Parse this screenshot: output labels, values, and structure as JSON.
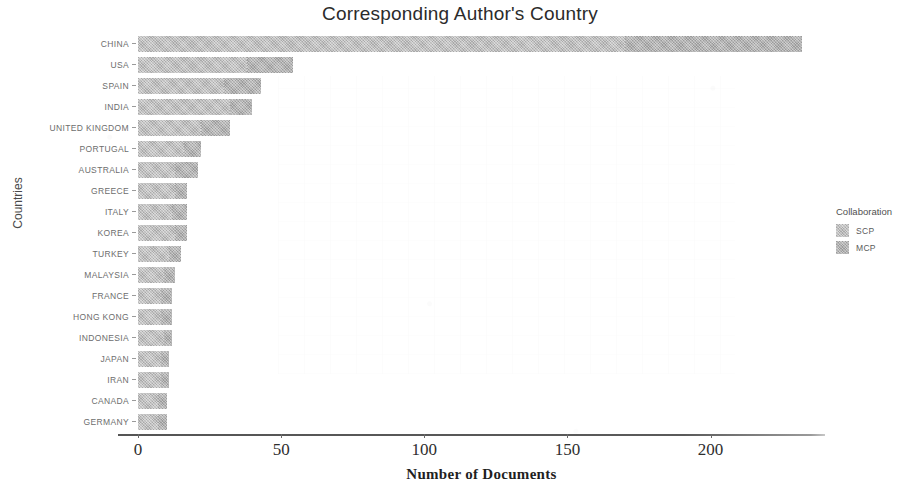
{
  "chart_data": {
    "type": "bar",
    "orientation": "horizontal",
    "title": "Corresponding Author's Country",
    "xlabel": "Number of Documents",
    "ylabel": "Countries",
    "xlim": [
      0,
      240
    ],
    "xticks": [
      0,
      50,
      100,
      150,
      200
    ],
    "xtick_labels": [
      "0",
      "50",
      "100",
      "150",
      "200"
    ],
    "grid": false,
    "legend_position": "right",
    "legend_title": "Collaboration",
    "categories": [
      "CHINA",
      "USA",
      "SPAIN",
      "INDIA",
      "UNITED KINGDOM",
      "PORTUGAL",
      "AUSTRALIA",
      "GREECE",
      "ITALY",
      "KOREA",
      "TURKEY",
      "MALAYSIA",
      "FRANCE",
      "HONG KONG",
      "INDONESIA",
      "JAPAN",
      "IRAN",
      "CANADA",
      "GERMANY"
    ],
    "series": [
      {
        "name": "SCP",
        "color": "#b9b9b9",
        "values": [
          170,
          38,
          30,
          32,
          22,
          16,
          13,
          13,
          12,
          13,
          11,
          9,
          8,
          8,
          9,
          8,
          8,
          7,
          7
        ]
      },
      {
        "name": "MCP",
        "color": "#aeaeae",
        "values": [
          62,
          16,
          13,
          8,
          10,
          6,
          8,
          4,
          5,
          4,
          4,
          4,
          4,
          4,
          3,
          3,
          3,
          3,
          3
        ]
      }
    ],
    "totals": [
      232,
      54,
      43,
      40,
      32,
      22,
      21,
      17,
      17,
      17,
      15,
      13,
      12,
      12,
      12,
      11,
      11,
      10,
      10
    ]
  },
  "legend": {
    "title": "Collaboration",
    "items": [
      {
        "label": "SCP",
        "color": "#b9b9b9"
      },
      {
        "label": "MCP",
        "color": "#aeaeae"
      }
    ]
  }
}
